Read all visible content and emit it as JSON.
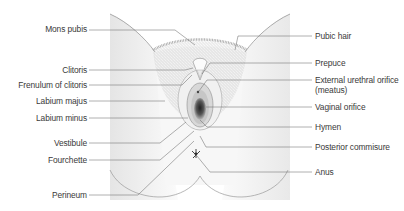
{
  "diagram": {
    "colors": {
      "skin_outline": "#8a8a8a",
      "skin_fill": "#f3f3f3",
      "hair": "#b9b9b9",
      "leader": "#6e6e6e",
      "text": "#3a3a3a",
      "orifice_dark": "#4a4a4a"
    },
    "labels_left": [
      {
        "id": "mons-pubis",
        "text": "Mons pubis"
      },
      {
        "id": "clitoris",
        "text": "Clitoris"
      },
      {
        "id": "frenulum-of-clitoris",
        "text": "Frenulum of clitoris"
      },
      {
        "id": "labium-majus",
        "text": "Labium majus"
      },
      {
        "id": "labium-minus",
        "text": "Labium minus"
      },
      {
        "id": "vestibule",
        "text": "Vestibule"
      },
      {
        "id": "fourchette",
        "text": "Fourchette"
      },
      {
        "id": "perineum",
        "text": "Perineum"
      }
    ],
    "labels_right": [
      {
        "id": "pubic-hair",
        "text": "Pubic hair"
      },
      {
        "id": "prepuce",
        "text": "Prepuce"
      },
      {
        "id": "external-urethral-orifice",
        "text": "External urethral orifice",
        "text2": "(meatus)"
      },
      {
        "id": "vaginal-orifice",
        "text": "Vaginal orifice"
      },
      {
        "id": "hymen",
        "text": "Hymen"
      },
      {
        "id": "posterior-commisure",
        "text": "Posterior commisure"
      },
      {
        "id": "anus",
        "text": "Anus"
      }
    ]
  }
}
